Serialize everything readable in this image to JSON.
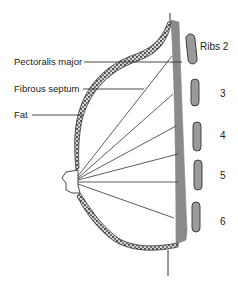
{
  "diagram": {
    "type": "anatomical cross-section",
    "labels": {
      "pectoralis": "Pectoralis major",
      "septum": "Fibrous septum",
      "fat": "Fat"
    },
    "ribs": [
      {
        "label": "Ribs 2"
      },
      {
        "label": "3"
      },
      {
        "label": "4"
      },
      {
        "label": "5"
      },
      {
        "label": "6"
      }
    ],
    "colors": {
      "muscle": "#8a8a8a",
      "outline": "#333333",
      "fat_texture": "#555555",
      "rib_fill": "#9a9a9a",
      "background": "#ffffff"
    }
  }
}
